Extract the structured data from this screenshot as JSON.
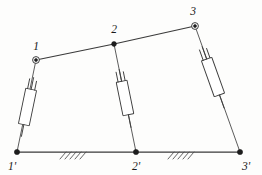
{
  "figure": {
    "kind": "kinematic-mechanism-diagram",
    "background_color": "#fdfdfc",
    "line_color": "#3a3a3a"
  },
  "labels": {
    "top_joint_1": "1",
    "top_joint_2": "2",
    "top_joint_3": "3",
    "ground_joint_1": "1'",
    "ground_joint_2": "2'",
    "ground_joint_3": "3'"
  },
  "joints": {
    "top": [
      {
        "name": "1",
        "x": 36,
        "y": 60,
        "style": "open-circle"
      },
      {
        "name": "2",
        "x": 114,
        "y": 44,
        "style": "filled-dot"
      },
      {
        "name": "3",
        "x": 195,
        "y": 26,
        "style": "open-circle"
      }
    ],
    "ground": [
      {
        "name": "1'",
        "x": 17,
        "y": 152,
        "style": "filled-dot"
      },
      {
        "name": "2'",
        "x": 136,
        "y": 152,
        "style": "filled-dot"
      },
      {
        "name": "3'",
        "x": 240,
        "y": 152,
        "style": "filled-dot"
      }
    ]
  },
  "members": {
    "coupler_segments": [
      {
        "name": "coupler-1-2",
        "from": "1",
        "to": "2"
      },
      {
        "name": "coupler-2-3",
        "from": "2",
        "to": "3"
      }
    ],
    "links": [
      {
        "name": "link-1-1prime",
        "from": "1",
        "to": "1'",
        "has_damper": true
      },
      {
        "name": "link-2-2prime",
        "from": "2",
        "to": "2'",
        "has_damper": true
      },
      {
        "name": "link-3-3prime",
        "from": "3",
        "to": "3'",
        "has_damper": true
      }
    ],
    "ground_bar": {
      "name": "ground-bar",
      "from": "1'",
      "to": "3'"
    }
  },
  "dampers": [
    {
      "name": "damper-left",
      "on_link": "link-1-1prime",
      "symbol": "dashpot"
    },
    {
      "name": "damper-middle",
      "on_link": "link-2-2prime",
      "symbol": "dashpot"
    },
    {
      "name": "damper-right",
      "on_link": "link-3-3prime",
      "symbol": "dashpot"
    }
  ],
  "ground_hatching": [
    {
      "name": "hatch-group-left",
      "center_x": 72,
      "y": 152,
      "strokes": 5
    },
    {
      "name": "hatch-group-right",
      "center_x": 180,
      "y": 152,
      "strokes": 5
    }
  ]
}
